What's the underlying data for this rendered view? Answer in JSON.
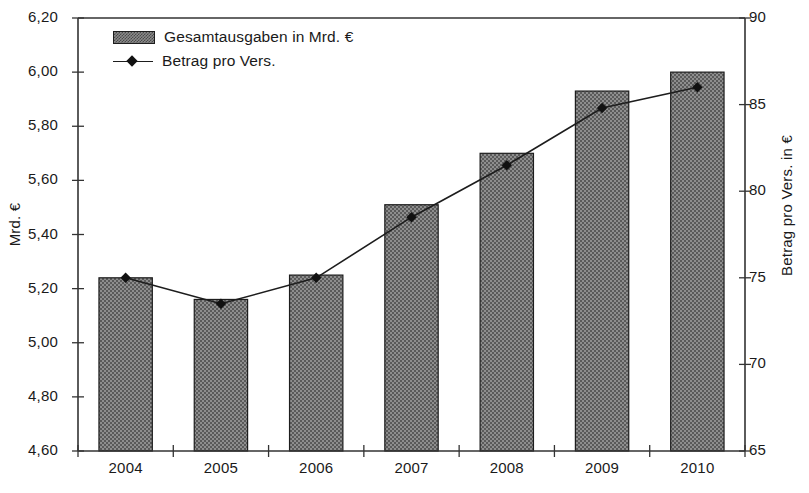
{
  "chart_data": {
    "type": "bar",
    "title": "",
    "categories": [
      "2004",
      "2005",
      "2006",
      "2007",
      "2008",
      "2009",
      "2010"
    ],
    "xlabel": "",
    "ylabel": "Mrd. €",
    "y2label": "Betrag pro Vers. in €",
    "ylim": [
      4.6,
      6.2
    ],
    "y2lim": [
      65,
      90
    ],
    "ytick_labels": [
      "6,20",
      "6,00",
      "5,80",
      "5,60",
      "5,40",
      "5,20",
      "5,00",
      "4,80",
      "4,60"
    ],
    "ytick_values": [
      6.2,
      6.0,
      5.8,
      5.6,
      5.4,
      5.2,
      5.0,
      4.8,
      4.6
    ],
    "y2tick_labels": [
      "90",
      "85",
      "80",
      "75",
      "70",
      "65"
    ],
    "y2tick_values": [
      90,
      85,
      80,
      75,
      70,
      65
    ],
    "grid": false,
    "legend_position": "top-left",
    "series": [
      {
        "name": "Gesamtausgaben in Mrd. €",
        "type": "bar",
        "axis": "left",
        "values": [
          5.24,
          5.16,
          5.25,
          5.51,
          5.7,
          5.93,
          6.0
        ]
      },
      {
        "name": "Betrag pro Vers.",
        "type": "line",
        "axis": "right",
        "values": [
          75.0,
          73.5,
          75.0,
          78.5,
          81.5,
          84.8,
          86.0
        ]
      }
    ],
    "colors": {
      "bar_fill": "#8a8a8a",
      "bar_pattern": "#4a4a4a",
      "bar_edge": "#1d1d1d",
      "line": "#1d1d1d",
      "marker": "#111111",
      "axis": "#333333",
      "text": "#1a1a1a",
      "background": "#ffffff"
    }
  },
  "legend": {
    "items": [
      {
        "label": "Gesamtausgaben in Mrd. €",
        "marker": "bar-swatch-icon"
      },
      {
        "label": "Betrag pro Vers.",
        "marker": "line-diamond-marker-icon"
      }
    ]
  },
  "axes": {
    "left_title": "Mrd. €",
    "right_title": "Betrag pro Vers. in €"
  }
}
